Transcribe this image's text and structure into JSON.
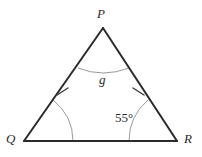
{
  "figure": {
    "type": "isosceles-triangle-diagram",
    "background_color": "#ffffff",
    "side_color": "#2b2b2b",
    "arc_color": "#9a9a9a",
    "tick_color": "#3a3a3a",
    "label_color": "#2b2b2b"
  },
  "vertices": {
    "P": {
      "label": "P",
      "x": 103,
      "y": 28
    },
    "Q": {
      "label": "Q",
      "x": 24,
      "y": 141
    },
    "R": {
      "label": "R",
      "x": 177,
      "y": 141
    }
  },
  "angles": {
    "P": {
      "label": "g",
      "marked": true
    },
    "Q": {
      "label": "",
      "marked": true
    },
    "R": {
      "label": "55°",
      "value": 55,
      "marked": true
    }
  },
  "sides": {
    "PQ": {
      "tick_marks": 1
    },
    "PR": {
      "tick_marks": 1
    },
    "QR": {
      "tick_marks": 0
    }
  }
}
